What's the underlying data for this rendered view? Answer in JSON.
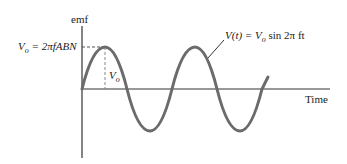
{
  "diagram": {
    "y_axis_label": "emf",
    "x_axis_label": "Time",
    "peak_label": "V_o = 2πfABN",
    "peak_label_parts": {
      "v": "V",
      "sub": "o",
      "rest": " = 2πfABN"
    },
    "amplitude_label": {
      "v": "V",
      "sub": "o"
    },
    "equation_label": {
      "v": "V(t) = V",
      "sub": "o",
      "rest": " sin 2π ft"
    },
    "colors": {
      "curve": "#6b6b6b",
      "axis": "#333333",
      "text": "#222222"
    }
  }
}
